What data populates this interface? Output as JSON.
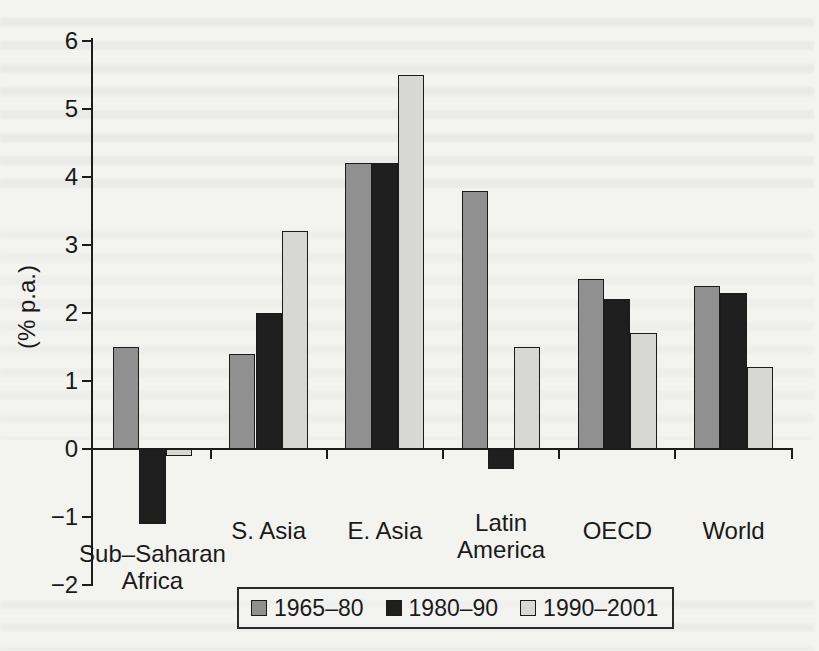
{
  "figure": {
    "background": "#f3f3f0",
    "axis_color": "#1c1c1c",
    "text_color": "#1a1a1a"
  },
  "chart_data": {
    "type": "bar",
    "title": "",
    "xlabel": "",
    "ylabel": "(% p.a.)",
    "ylim": [
      -2,
      6
    ],
    "yticks": [
      6,
      5,
      4,
      3,
      2,
      1,
      0,
      -1,
      -2
    ],
    "grid": false,
    "legend_position": "bottom",
    "categories": [
      "Sub–Saharan Africa",
      "S. Asia",
      "E. Asia",
      "Latin America",
      "OECD",
      "World"
    ],
    "category_label_lines": [
      [
        "Sub–Saharan",
        "Africa"
      ],
      [
        "S. Asia"
      ],
      [
        "E. Asia"
      ],
      [
        "Latin",
        "America"
      ],
      [
        "OECD"
      ],
      [
        "World"
      ]
    ],
    "series": [
      {
        "name": "1965–80",
        "color": "#909090",
        "values": [
          1.5,
          1.4,
          4.2,
          3.8,
          2.5,
          2.4
        ]
      },
      {
        "name": "1980–90",
        "color": "#1e1e1e",
        "values": [
          -1.1,
          2.0,
          4.2,
          -0.3,
          2.2,
          2.3
        ]
      },
      {
        "name": "1990–2001",
        "color": "#d7d7d4",
        "values": [
          -0.1,
          3.2,
          5.5,
          1.5,
          1.7,
          1.2
        ]
      }
    ]
  }
}
